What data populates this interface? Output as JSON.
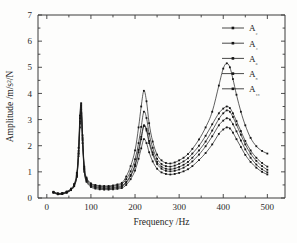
{
  "chart_data": {
    "type": "line",
    "title": "",
    "xlabel": "Frequency /Hz",
    "ylabel": "Amplitude /m/s²/N",
    "xlim": [
      -20,
      540
    ],
    "ylim": [
      0,
      7
    ],
    "xticks": [
      0,
      100,
      200,
      300,
      400,
      500
    ],
    "yticks": [
      0,
      1,
      2,
      3,
      4,
      5,
      6,
      7
    ],
    "xtick_labels": [
      "0",
      "100",
      "200",
      "300",
      "400",
      "500"
    ],
    "ytick_labels": [
      "0",
      "1",
      "2",
      "3",
      "4",
      "5",
      "6",
      "7"
    ],
    "grid": false,
    "legend_position": "top-right",
    "marker": "square",
    "line_color": "#1b1b1b",
    "x": [
      15,
      25,
      35,
      45,
      55,
      62,
      68,
      72,
      75,
      78,
      81,
      85,
      90,
      100,
      110,
      120,
      130,
      140,
      150,
      160,
      170,
      180,
      190,
      200,
      208,
      214,
      220,
      226,
      232,
      240,
      250,
      260,
      270,
      280,
      290,
      300,
      310,
      320,
      330,
      345,
      360,
      375,
      390,
      400,
      408,
      415,
      422,
      430,
      440,
      450,
      462,
      475,
      488,
      500
    ],
    "series": [
      {
        "name": "A2",
        "label": "A₂",
        "values": [
          0.2,
          0.14,
          0.15,
          0.2,
          0.3,
          0.45,
          0.8,
          1.6,
          2.7,
          3.25,
          2.1,
          1.0,
          0.62,
          0.42,
          0.36,
          0.33,
          0.32,
          0.32,
          0.33,
          0.35,
          0.38,
          0.5,
          0.72,
          1.05,
          1.5,
          1.9,
          2.25,
          2.1,
          1.75,
          1.4,
          1.12,
          0.98,
          0.92,
          0.9,
          0.92,
          0.96,
          1.02,
          1.1,
          1.22,
          1.45,
          1.72,
          2.05,
          2.45,
          2.62,
          2.7,
          2.66,
          2.5,
          2.25,
          1.95,
          1.65,
          1.38,
          1.16,
          1.0,
          0.9
        ]
      },
      {
        "name": "A4",
        "label": "A₄",
        "values": [
          0.21,
          0.15,
          0.16,
          0.21,
          0.31,
          0.47,
          0.84,
          1.68,
          2.85,
          3.4,
          2.2,
          1.06,
          0.66,
          0.46,
          0.4,
          0.37,
          0.36,
          0.36,
          0.37,
          0.39,
          0.43,
          0.58,
          0.84,
          1.22,
          1.75,
          2.25,
          2.75,
          2.58,
          2.1,
          1.66,
          1.3,
          1.12,
          1.04,
          1.02,
          1.04,
          1.09,
          1.16,
          1.26,
          1.4,
          1.66,
          1.98,
          2.36,
          2.78,
          2.96,
          3.05,
          3.0,
          2.82,
          2.55,
          2.2,
          1.86,
          1.54,
          1.28,
          1.1,
          0.98
        ]
      },
      {
        "name": "A6",
        "label": "A₆",
        "values": [
          0.22,
          0.16,
          0.17,
          0.22,
          0.32,
          0.48,
          0.86,
          1.72,
          2.92,
          3.48,
          2.26,
          1.1,
          0.7,
          0.49,
          0.43,
          0.4,
          0.39,
          0.39,
          0.4,
          0.43,
          0.47,
          0.62,
          0.88,
          1.28,
          1.84,
          2.34,
          2.78,
          2.64,
          2.18,
          1.74,
          1.38,
          1.2,
          1.12,
          1.1,
          1.13,
          1.19,
          1.27,
          1.38,
          1.54,
          1.82,
          2.16,
          2.58,
          3.02,
          3.24,
          3.35,
          3.3,
          3.1,
          2.8,
          2.42,
          2.05,
          1.7,
          1.42,
          1.22,
          1.08
        ]
      },
      {
        "name": "A8",
        "label": "A₈",
        "values": [
          0.23,
          0.17,
          0.18,
          0.23,
          0.34,
          0.5,
          0.9,
          1.8,
          3.05,
          3.55,
          2.32,
          1.14,
          0.74,
          0.53,
          0.47,
          0.44,
          0.43,
          0.43,
          0.45,
          0.48,
          0.53,
          0.72,
          1.02,
          1.48,
          2.1,
          2.72,
          3.3,
          3.06,
          2.46,
          1.92,
          1.5,
          1.3,
          1.22,
          1.2,
          1.24,
          1.31,
          1.4,
          1.52,
          1.7,
          2.0,
          2.38,
          2.82,
          3.24,
          3.42,
          3.5,
          3.44,
          3.24,
          2.94,
          2.56,
          2.18,
          1.82,
          1.54,
          1.34,
          1.2
        ]
      },
      {
        "name": "A10",
        "label": "A₁₀",
        "values": [
          0.24,
          0.18,
          0.19,
          0.25,
          0.36,
          0.54,
          0.96,
          1.92,
          3.15,
          3.62,
          2.4,
          1.2,
          0.78,
          0.56,
          0.5,
          0.47,
          0.46,
          0.46,
          0.48,
          0.52,
          0.58,
          0.82,
          1.22,
          1.82,
          2.7,
          3.5,
          4.1,
          3.7,
          2.86,
          2.16,
          1.66,
          1.44,
          1.34,
          1.32,
          1.36,
          1.44,
          1.54,
          1.68,
          1.88,
          2.24,
          2.7,
          3.3,
          4.3,
          4.95,
          5.15,
          5.0,
          4.55,
          3.95,
          3.3,
          2.78,
          2.3,
          1.98,
          1.8,
          1.7
        ]
      }
    ]
  }
}
